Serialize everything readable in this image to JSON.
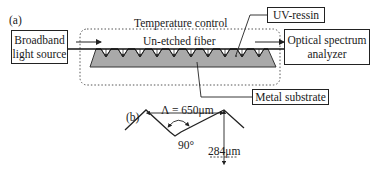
{
  "figure": {
    "panel_a": {
      "label": "(a)",
      "source_box": {
        "line1": "Broadband",
        "line2": "light source"
      },
      "analyzer_box": {
        "line1": "Optical spectrum",
        "line2": "analyzer"
      },
      "temperature_region_label": "Temperature control",
      "fiber_label": "Un-etched fiber",
      "uv_resin_label": "UV-ressin",
      "substrate_label": "Metal substrate",
      "groove_count": 11
    },
    "panel_b": {
      "label": "(b)",
      "period_label": "Λ = 650μm",
      "angle_label": "90°",
      "depth_label": "284μm"
    },
    "colors": {
      "line": "#222222",
      "substrate_fill": "#a9a9a9",
      "dotted_border": "#555555"
    }
  }
}
